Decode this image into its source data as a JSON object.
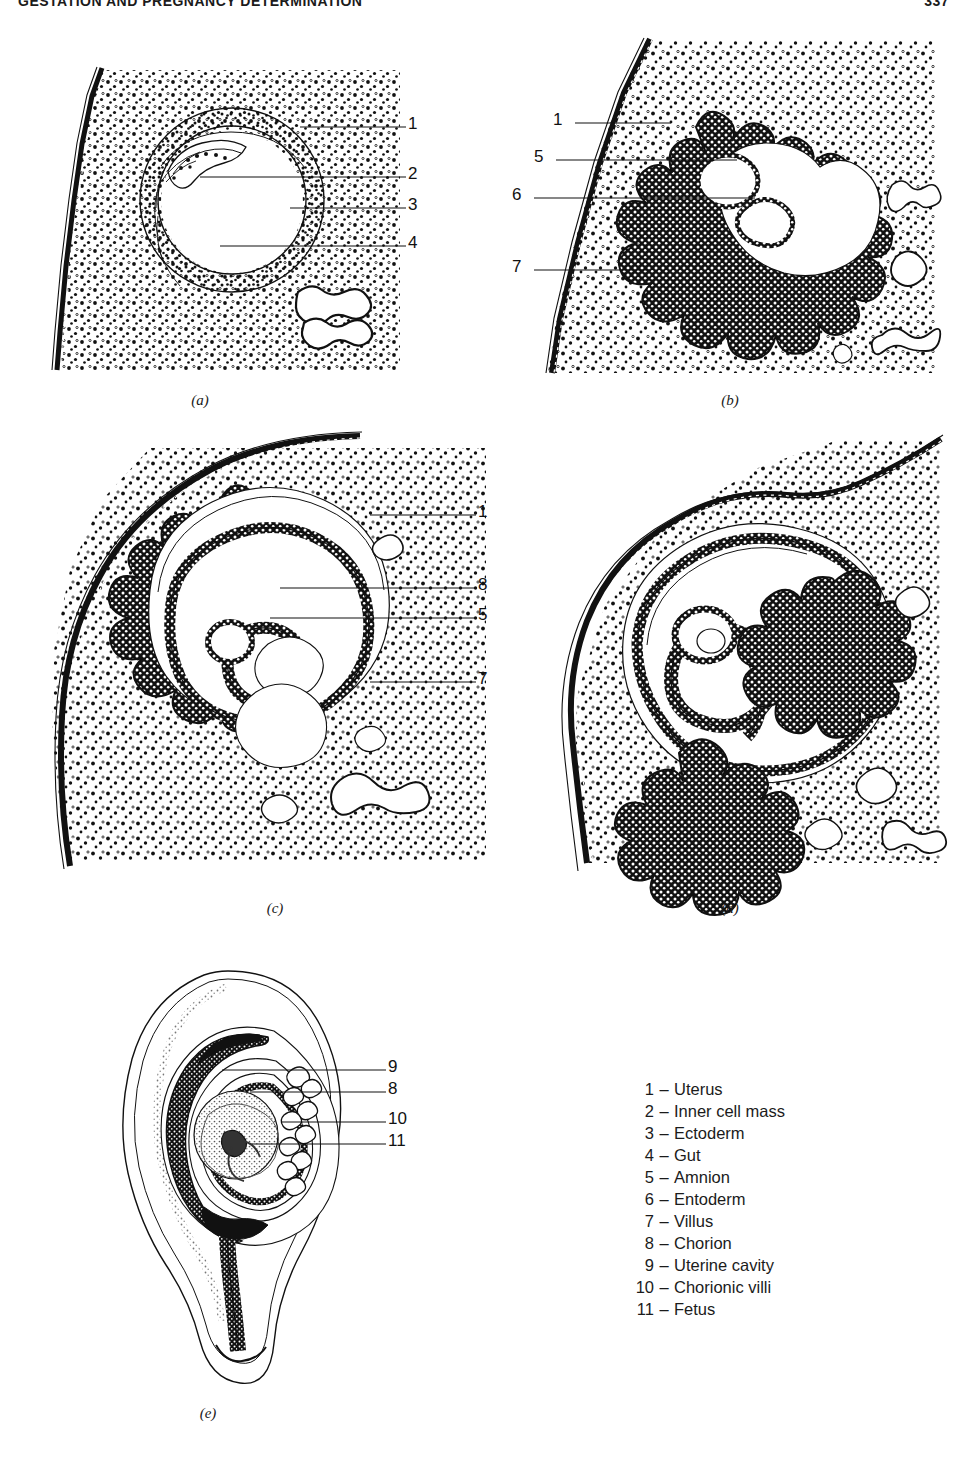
{
  "running_head": {
    "title": "GESTATION AND PREGNANCY DETERMINATION",
    "page_number": "337"
  },
  "figure": {
    "panels": [
      {
        "id": "a",
        "caption": "(a)",
        "description": "Early blastocyst implanted in stippled uterine wall; inner cell mass and gut cavity visible",
        "callouts": [
          {
            "number": "1",
            "target": "Uterus"
          },
          {
            "number": "2",
            "target": "Inner cell mass"
          },
          {
            "number": "3",
            "target": "Ectoderm"
          },
          {
            "number": "4",
            "target": "Gut"
          }
        ]
      },
      {
        "id": "b",
        "caption": "(b)",
        "description": "Later conceptus surrounded by convoluted chorionic villi within uterine wall",
        "callouts": [
          {
            "number": "1",
            "target": "Uterus"
          },
          {
            "number": "5",
            "target": "Amnion"
          },
          {
            "number": "6",
            "target": "Entoderm"
          },
          {
            "number": "7",
            "target": "Villus"
          }
        ]
      },
      {
        "id": "c",
        "caption": "(c)",
        "description": "Embryo coiled within amnion and chorion, ringed by villi",
        "callouts": [
          {
            "number": "1",
            "target": "Uterus"
          },
          {
            "number": "8",
            "target": "Chorion"
          },
          {
            "number": "5",
            "target": "Amnion"
          },
          {
            "number": "7",
            "target": "Villus"
          }
        ]
      },
      {
        "id": "d",
        "caption": "(d)",
        "description": "Further developed embryo with villi concentrated to one side",
        "callouts": []
      },
      {
        "id": "e",
        "caption": "(e)",
        "description": "Fetus within uterine horn showing uterine cavity, chorion, chorionic villi",
        "callouts": [
          {
            "number": "9",
            "target": "Uterine cavity"
          },
          {
            "number": "8",
            "target": "Chorion"
          },
          {
            "number": "10",
            "target": "Chorionic villi"
          },
          {
            "number": "11",
            "target": "Fetus"
          }
        ]
      }
    ]
  },
  "legend": {
    "items": [
      {
        "number": "1",
        "dash": "–",
        "label": "Uterus"
      },
      {
        "number": "2",
        "dash": "–",
        "label": "Inner cell mass"
      },
      {
        "number": "3",
        "dash": "–",
        "label": "Ectoderm"
      },
      {
        "number": "4",
        "dash": "–",
        "label": "Gut"
      },
      {
        "number": "5",
        "dash": "–",
        "label": "Amnion"
      },
      {
        "number": "6",
        "dash": "–",
        "label": "Entoderm"
      },
      {
        "number": "7",
        "dash": "–",
        "label": "Villus"
      },
      {
        "number": "8",
        "dash": "–",
        "label": "Chorion"
      },
      {
        "number": "9",
        "dash": "–",
        "label": "Uterine cavity"
      },
      {
        "number": "10",
        "dash": "–",
        "label": "Chorionic villi"
      },
      {
        "number": "11",
        "dash": "–",
        "label": "Fetus"
      }
    ]
  },
  "colors": {
    "ink": "#111111",
    "paper": "#ffffff"
  }
}
